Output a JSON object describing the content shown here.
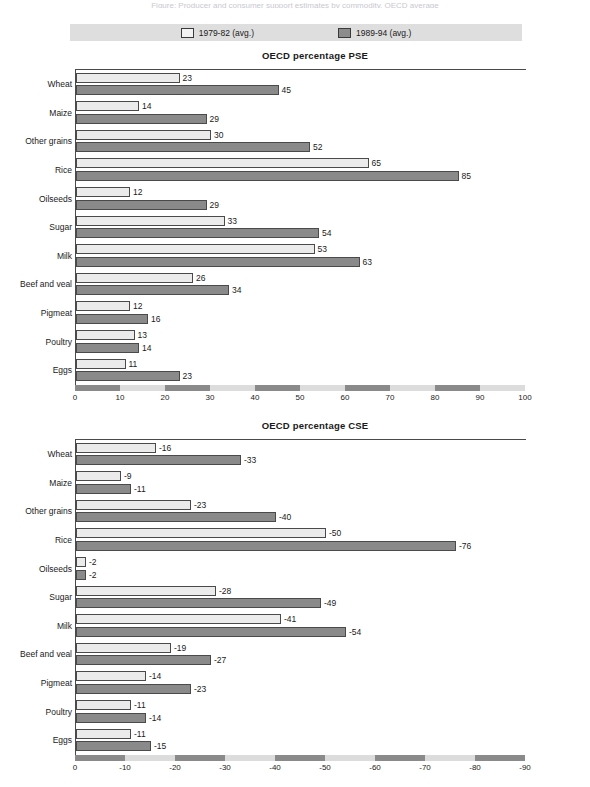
{
  "top_caption": "Figure: Producer and consumer support estimates by commodity, OECD average",
  "legend": {
    "items": [
      {
        "label": "1979-82 (avg.)",
        "swatch": "light"
      },
      {
        "label": "1989-94 (avg.)",
        "swatch": "dark"
      }
    ]
  },
  "chart_data": [
    {
      "type": "bar",
      "id": "pse",
      "title": "OECD percentage PSE",
      "orientation": "horizontal",
      "xlabel": "",
      "ylabel": "",
      "xlim": [
        0,
        100
      ],
      "xticks": [
        0,
        10,
        20,
        30,
        40,
        50,
        60,
        70,
        80,
        90,
        100
      ],
      "xtick_labels": [
        "0",
        "10",
        "20",
        "30",
        "40",
        "50",
        "60",
        "70",
        "80",
        "90",
        "100"
      ],
      "grid": false,
      "legend_position": "top",
      "categories": [
        "Wheat",
        "Maize",
        "Other grains",
        "Rice",
        "Oilseeds",
        "Sugar",
        "Milk",
        "Beef and veal",
        "Pigmeat",
        "Poultry",
        "Eggs"
      ],
      "series": [
        {
          "name": "1979-82 (avg.)",
          "color": "#ebebeb",
          "values": [
            23,
            14,
            30,
            65,
            12,
            33,
            53,
            26,
            12,
            13,
            11
          ]
        },
        {
          "name": "1989-94 (avg.)",
          "color": "#8a8a8a",
          "values": [
            45,
            29,
            52,
            85,
            29,
            54,
            63,
            34,
            16,
            14,
            23
          ]
        }
      ]
    },
    {
      "type": "bar",
      "id": "cse",
      "title": "OECD percentage CSE",
      "orientation": "horizontal",
      "xlabel": "",
      "ylabel": "",
      "xlim": [
        0,
        -90
      ],
      "xticks": [
        0,
        -10,
        -20,
        -30,
        -40,
        -50,
        -60,
        -70,
        -80,
        -90
      ],
      "xtick_labels": [
        "0",
        "-10",
        "-20",
        "-30",
        "-40",
        "-50",
        "-60",
        "-70",
        "-80",
        "-90"
      ],
      "grid": false,
      "legend_position": "top",
      "categories": [
        "Wheat",
        "Maize",
        "Other grains",
        "Rice",
        "Oilseeds",
        "Sugar",
        "Milk",
        "Beef and veal",
        "Pigmeat",
        "Poultry",
        "Eggs"
      ],
      "series": [
        {
          "name": "1979-82 (avg.)",
          "color": "#ebebeb",
          "values": [
            -16,
            -9,
            -23,
            -50,
            -2,
            -28,
            -41,
            -19,
            -14,
            -11,
            -11
          ]
        },
        {
          "name": "1989-94 (avg.)",
          "color": "#8a8a8a",
          "values": [
            -33,
            -11,
            -40,
            -76,
            -2,
            -49,
            -54,
            -27,
            -23,
            -14,
            -15
          ]
        }
      ]
    }
  ]
}
